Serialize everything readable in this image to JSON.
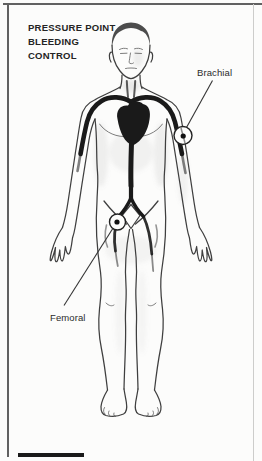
{
  "figure": {
    "title_lines": [
      "PRESSURE POINT",
      "BLEEDING",
      "CONTROL"
    ],
    "labels": {
      "brachial": "Brachial",
      "femoral": "Femoral"
    },
    "colors": {
      "page_bg": "#fcfcfb",
      "frame_border": "#616161",
      "line": "#3f3f3f",
      "artery": "#1a1a1a",
      "title_text": "#242424",
      "label_text": "#2b2b2b"
    }
  }
}
